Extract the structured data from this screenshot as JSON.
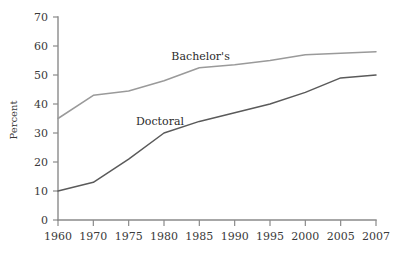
{
  "chart_data": {
    "type": "line",
    "title": "",
    "xlabel": "",
    "ylabel": "Percent",
    "ylim": [
      0,
      70
    ],
    "ytick_step": 10,
    "grid": false,
    "legend_position": "inline-labels",
    "categories": [
      "1960",
      "1970",
      "1975",
      "1980",
      "1985",
      "1990",
      "1995",
      "2000",
      "2005",
      "2007"
    ],
    "yticks": [
      "0",
      "10",
      "20",
      "30",
      "40",
      "50",
      "60",
      "70"
    ],
    "series": [
      {
        "name": "Bachelor's",
        "color": "#9a9a9a",
        "label_x_category": "1985",
        "values": [
          35,
          43,
          44.5,
          48,
          52.5,
          53.5,
          55,
          57,
          57.5,
          58
        ]
      },
      {
        "name": "Doctoral",
        "color": "#5a5a5a",
        "label_x_category": "1980",
        "values": [
          10,
          13,
          21,
          30,
          34,
          37,
          40,
          44,
          49,
          50
        ]
      }
    ]
  },
  "axis": {
    "y_title": "Percent"
  },
  "colors": {
    "axis": "#8a8a8a",
    "text": "#3a3a3a",
    "background": "#ffffff",
    "bachelors_line": "#9a9a9a",
    "doctoral_line": "#5a5a5a"
  }
}
